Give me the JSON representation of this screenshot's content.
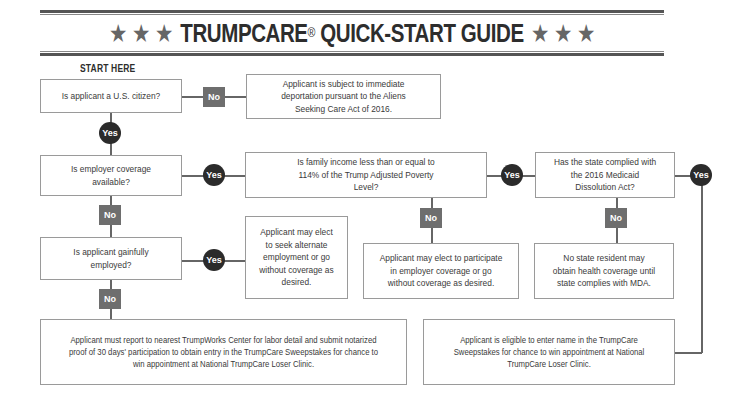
{
  "header": {
    "stars_left": "★ ★ ★",
    "title": "TRUMPCARE",
    "registered": "®",
    "subtitle": " QUICK-START GUIDE",
    "stars_right": "★ ★ ★"
  },
  "start_label": "START HERE",
  "labels": {
    "yes": "Yes",
    "no": "No"
  },
  "nodes": {
    "citizen_question": "Is applicant a U.S. citizen?",
    "deportation_outcome": "Applicant is subject to immediate deportation pursuant to the Aliens Seeking Care Act of 2016.",
    "employer_question": "Is employer coverage available?",
    "income_question": "Is family income less than or equal to 114% of the Trump Adjusted Poverty Level?",
    "state_question": "Has the state complied with the 2016 Medicaid Dissolution Act?",
    "employed_question": "Is applicant gainfully employed?",
    "alternate_outcome": "Applicant may elect to seek alternate employment or go without coverage as desired.",
    "participate_outcome": "Applicant may elect to participate in employer coverage or go without coverage as desired.",
    "no_resident_outcome": "No state resident may obtain health coverage until state complies with MDA.",
    "trumpworks_outcome": "Applicant must report to nearest TrumpWorks Center for labor detail and submit notarized proof of 30 days' participation to obtain entry in the TrumpCare Sweepstakes for chance to win appointment at National TrumpCare Loser Clinic.",
    "sweepstakes_outcome": "Applicant is eligible to enter name in the TrumpCare Sweepstakes for chance to win appointment at National TrumpCare Loser Clinic."
  },
  "colors": {
    "no_badge": "#6e6e6e",
    "yes_badge": "#2b2b2b",
    "box_border": "#9a9a9a",
    "connector": "#666666"
  }
}
